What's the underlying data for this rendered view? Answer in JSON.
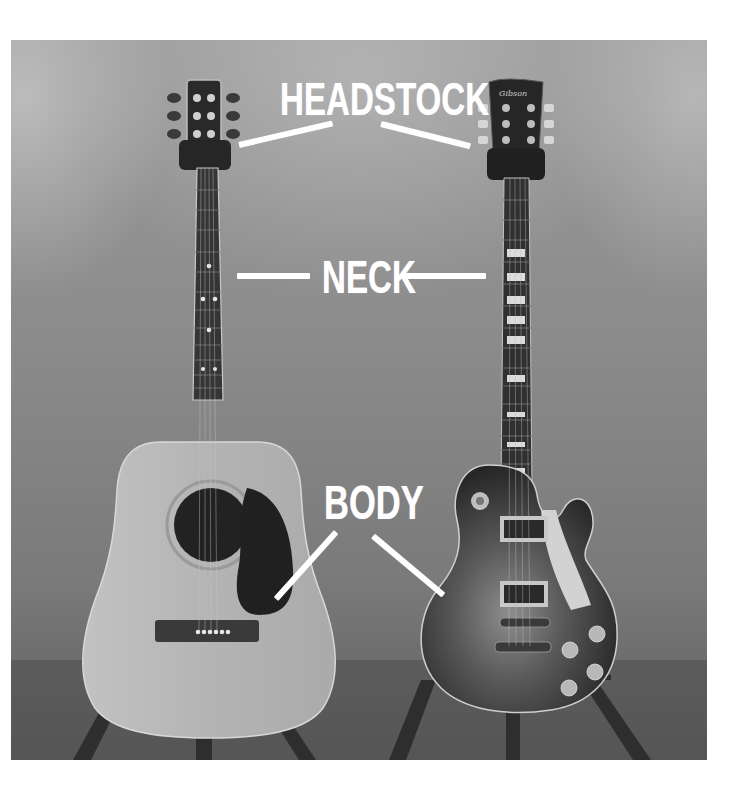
{
  "image": {
    "description": "Side-by-side photo of an acoustic guitar and an electric guitar on stands with labeled parts",
    "subjects": [
      {
        "name": "acoustic-guitar",
        "type": "dreadnought acoustic"
      },
      {
        "name": "electric-guitar",
        "type": "single-cut electric",
        "headstock_logo": "Gibson"
      }
    ]
  },
  "labels": {
    "headstock": "HEADSTOCK",
    "neck": "NECK",
    "body": "BODY"
  },
  "colors": {
    "background_gray": "#8c8c8c",
    "label_white": "#ffffff",
    "acoustic_top": "#b9b9b9",
    "fretboard": "#3a3a3a",
    "electric_body_dark": "#2e2e2e"
  }
}
